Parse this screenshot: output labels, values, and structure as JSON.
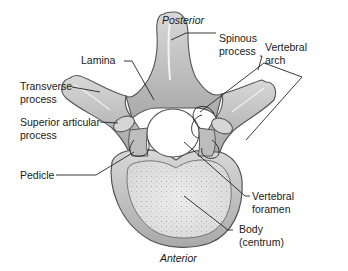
{
  "diagram": {
    "orientation": {
      "top": "Posterior",
      "bottom": "Anterior"
    },
    "labels": {
      "spinous_process": [
        "Spinous",
        "process"
      ],
      "lamina": "Lamina",
      "vertebral_arch": [
        "Vertebral",
        "arch"
      ],
      "transverse_process": [
        "Transverse",
        "process"
      ],
      "superior_articular_process": [
        "Superior articular",
        "process"
      ],
      "pedicle": "Pedicle",
      "vertebral_foramen": [
        "Vertebral",
        "foramen"
      ],
      "body": [
        "Body",
        "(centrum)"
      ]
    },
    "colors": {
      "bone_fill": "#c9c9c9",
      "bone_stroke": "#555555",
      "cancellous": "#e4e4e4",
      "leader": "#222222",
      "text": "#1a1a1a"
    }
  }
}
